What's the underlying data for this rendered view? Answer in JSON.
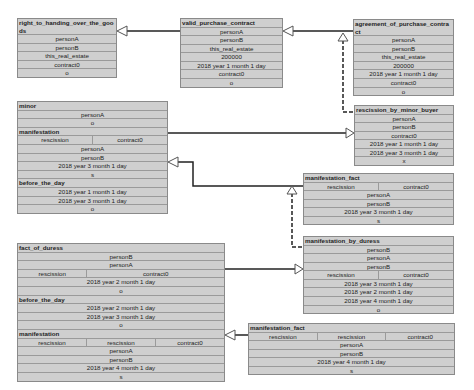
{
  "boxes": {
    "right_to_handing": {
      "title": "right_to_handing_over_the_goods",
      "rows": [
        "personA",
        "personB",
        "this_real_estate",
        "contract0",
        "o"
      ]
    },
    "valid_purchase_contract": {
      "title": "valid_purchase_contract",
      "rows": [
        "personA",
        "personB",
        "this_real_estate",
        "200000",
        "2018 year 1 month 1 day",
        "contract0",
        "o"
      ]
    },
    "agreement_of_purchase_contract": {
      "title": "agreement_of_purchase_contract",
      "rows": [
        "personA",
        "personB",
        "this_real_estate",
        "200000",
        "2018 year 1 month 1 day",
        "contract0",
        "o"
      ]
    },
    "rescission_by_minor_buyer": {
      "title": "rescission_by_minor_buyer",
      "rows": [
        "personA",
        "personB",
        "contract0",
        "2018 year 1 month 1 day",
        "2018 year 3 month 1 day",
        "x"
      ]
    },
    "minor_group": {
      "minor_title": "minor",
      "minor_rows": [
        "personA",
        "o"
      ],
      "manifestation_title": "manifestation",
      "manifestation_split": [
        "rescission",
        "contract0"
      ],
      "manifestation_rows": [
        "personA",
        "personB",
        "2018 year 3 month 1 day",
        "s"
      ],
      "before_title": "before_the_day",
      "before_rows": [
        "2018 year 1 month 1 day",
        "2018 year 3 month 1 day",
        "o"
      ]
    },
    "manifestation_fact_1": {
      "title": "manifestation_fact",
      "split": [
        "rescission",
        "contract0"
      ],
      "rows": [
        "personA",
        "personB",
        "2018 year 3 month 1 day",
        "s"
      ]
    },
    "manifestation_by_duress": {
      "title": "manifestation_by_duress",
      "rows_top": [
        "personB",
        "personA",
        "personB"
      ],
      "split": [
        "rescission",
        "contract0"
      ],
      "rows": [
        "2018 year 3 month 1 day",
        "2018 year 2 month 1 day",
        "2018 year 4 month 1 day",
        "o"
      ]
    },
    "duress_group": {
      "fact_title": "fact_of_duress",
      "fact_rows_top": [
        "personB",
        "personA"
      ],
      "fact_split": [
        "rescission",
        "contract0"
      ],
      "fact_rows": [
        "2018 year 2 month 1 day",
        "o"
      ],
      "before_title": "before_the_day",
      "before_rows": [
        "2018 year 2 month 1 day",
        "2018 year 3 month 1 day",
        "o"
      ],
      "manifestation_title": "manifestation",
      "manifestation_split": [
        "rescission",
        "rescission",
        "contract0"
      ],
      "manifestation_rows": [
        "personA",
        "personB",
        "2018 year 4 month 1 day",
        "s"
      ]
    },
    "manifestation_fact_2": {
      "title": "manifestation_fact",
      "split": [
        "rescission",
        "rescission",
        "contract0"
      ],
      "rows": [
        "personA",
        "personB",
        "2018 year 4 month 1 day",
        "s"
      ]
    }
  }
}
